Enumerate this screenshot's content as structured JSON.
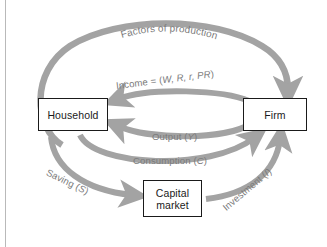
{
  "figure": {
    "background_color": "#ffffff",
    "arrow_color": "#a3a3a3",
    "label_color": "#7b7b7b",
    "node_border_color": "#1a1a1a",
    "rule_color": "#b9b9b9"
  },
  "nodes": [
    {
      "id": "household",
      "label": "Household"
    },
    {
      "id": "firm",
      "label": "Firm"
    },
    {
      "id": "capital_market",
      "label_line1": "Capital",
      "label_line2": "market"
    }
  ],
  "flows": [
    {
      "id": "factors_of_production",
      "label": "Factors of production",
      "from": "household",
      "to": "firm",
      "path": "outer-top-arc"
    },
    {
      "id": "income",
      "label_prefix": "Income = (",
      "label_vars": "W, R, r, PR",
      "label_suffix": ")",
      "label_full": "Income = (W, R, r, PR)",
      "from": "firm",
      "to": "household",
      "path": "upper-inner-arc"
    },
    {
      "id": "output",
      "label_prefix": "Output (",
      "label_vars": "Y",
      "label_suffix": ")",
      "label_full": "Output (Y)",
      "from": "firm",
      "to": "household",
      "path": "inner-arc"
    },
    {
      "id": "consumption",
      "label_prefix": "Consumption (",
      "label_vars": "C",
      "label_suffix": ")",
      "label_full": "Consumption (C)",
      "from": "household",
      "to": "firm",
      "path": "lower-inner-arc"
    },
    {
      "id": "saving",
      "label_prefix": "Saving (",
      "label_vars": "S",
      "label_suffix": ")",
      "label_full": "Saving (S)",
      "from": "household",
      "to": "capital_market",
      "path": "lower-left-arc"
    },
    {
      "id": "investment",
      "label_prefix": "Investment (",
      "label_vars": "I",
      "label_suffix": ")",
      "label_full": "Investment (I)",
      "from": "capital_market",
      "to": "firm",
      "path": "lower-right-arc"
    }
  ]
}
